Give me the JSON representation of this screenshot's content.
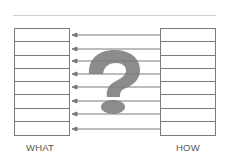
{
  "diagram": {
    "left_label": "WHAT",
    "right_label": "HOW",
    "rows": 8,
    "arrow_direction": "right-to-left",
    "center_icon": "question-mark-icon",
    "colors": {
      "lines": "#7a7a7a",
      "arrows": "#8a8a8a",
      "question_mark": "#8c8c8c",
      "top_rule": "#cfcfcf"
    }
  }
}
